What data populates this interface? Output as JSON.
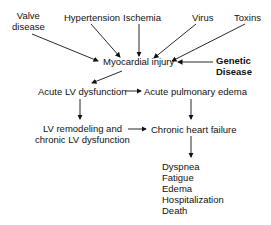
{
  "causes": {
    "valve": [
      "Valve",
      "disease"
    ],
    "hypertension": "Hypertension",
    "ischemia": "Ischemia",
    "virus": "Virus",
    "toxins": "Toxins",
    "genetic": [
      "Genetic",
      "Disease"
    ]
  },
  "nodes": {
    "myocardial_injury": "Myocardial injury",
    "acute_lv": "Acute LV dysfunction",
    "acute_pulm": "Acute pulmonary edema",
    "lv_remodel": [
      "LV remodeling and",
      "chronic LV dysfunction"
    ],
    "chf": "Chronic heart failure"
  },
  "outcomes": [
    "Dyspnea",
    "Fatigue",
    "Edema",
    "Hospitalization",
    "Death"
  ]
}
